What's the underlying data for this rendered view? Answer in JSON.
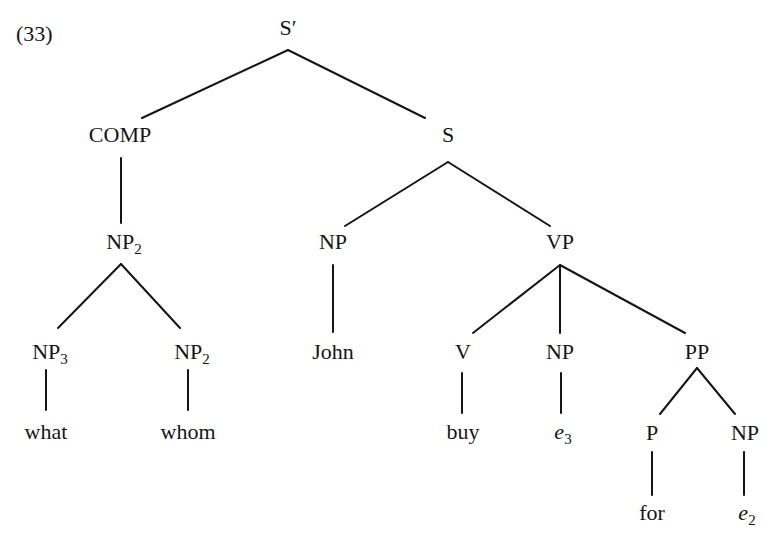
{
  "example_number": "(33)",
  "tree": {
    "nodes": [
      {
        "id": "s_bar",
        "label": "S′",
        "sub": "",
        "italic": false,
        "x": 288,
        "y": 16
      },
      {
        "id": "comp",
        "label": "COMP",
        "sub": "",
        "italic": false,
        "x": 120,
        "y": 123
      },
      {
        "id": "s",
        "label": "S",
        "sub": "",
        "italic": false,
        "x": 448,
        "y": 123
      },
      {
        "id": "np2_top",
        "label": "NP",
        "sub": "2",
        "italic": false,
        "x": 124,
        "y": 230
      },
      {
        "id": "np_subj",
        "label": "NP",
        "sub": "",
        "italic": false,
        "x": 333,
        "y": 230
      },
      {
        "id": "vp",
        "label": "VP",
        "sub": "",
        "italic": false,
        "x": 560,
        "y": 230
      },
      {
        "id": "np3",
        "label": "NP",
        "sub": "3",
        "italic": false,
        "x": 50,
        "y": 340
      },
      {
        "id": "np2_low",
        "label": "NP",
        "sub": "2",
        "italic": false,
        "x": 192,
        "y": 340
      },
      {
        "id": "john",
        "label": "John",
        "sub": "",
        "italic": false,
        "x": 333,
        "y": 340
      },
      {
        "id": "v",
        "label": "V",
        "sub": "",
        "italic": false,
        "x": 463,
        "y": 340
      },
      {
        "id": "np_obj",
        "label": "NP",
        "sub": "",
        "italic": false,
        "x": 560,
        "y": 340
      },
      {
        "id": "pp",
        "label": "PP",
        "sub": "",
        "italic": false,
        "x": 697,
        "y": 340
      },
      {
        "id": "what",
        "label": "what",
        "sub": "",
        "italic": false,
        "x": 46,
        "y": 420
      },
      {
        "id": "whom",
        "label": "whom",
        "sub": "",
        "italic": false,
        "x": 188,
        "y": 420
      },
      {
        "id": "buy",
        "label": "buy",
        "sub": "",
        "italic": false,
        "x": 463,
        "y": 420
      },
      {
        "id": "e3",
        "label": "e",
        "sub": "3",
        "italic": true,
        "x": 563,
        "y": 420
      },
      {
        "id": "p",
        "label": "P",
        "sub": "",
        "italic": false,
        "x": 652,
        "y": 421
      },
      {
        "id": "np_pobj",
        "label": "NP",
        "sub": "",
        "italic": false,
        "x": 745,
        "y": 421
      },
      {
        "id": "for",
        "label": "for",
        "sub": "",
        "italic": false,
        "x": 652,
        "y": 501
      },
      {
        "id": "e2",
        "label": "e",
        "sub": "2",
        "italic": true,
        "x": 747,
        "y": 501
      }
    ],
    "edges": [
      {
        "from": "s_bar",
        "to": "comp",
        "x1": 288,
        "y1": 50,
        "x2": 142,
        "y2": 118
      },
      {
        "from": "s_bar",
        "to": "s",
        "x1": 288,
        "y1": 50,
        "x2": 425,
        "y2": 118
      },
      {
        "from": "comp",
        "to": "np2_top",
        "x1": 121,
        "y1": 158,
        "x2": 121,
        "y2": 223
      },
      {
        "from": "s",
        "to": "np_subj",
        "x1": 448,
        "y1": 162,
        "x2": 345,
        "y2": 226
      },
      {
        "from": "s",
        "to": "vp",
        "x1": 448,
        "y1": 162,
        "x2": 550,
        "y2": 226
      },
      {
        "from": "np2_top",
        "to": "np3",
        "x1": 121,
        "y1": 264,
        "x2": 58,
        "y2": 328
      },
      {
        "from": "np2_top",
        "to": "np2_low",
        "x1": 121,
        "y1": 264,
        "x2": 180,
        "y2": 328
      },
      {
        "from": "np_subj",
        "to": "john",
        "x1": 333,
        "y1": 265,
        "x2": 333,
        "y2": 332
      },
      {
        "from": "vp",
        "to": "v",
        "x1": 560,
        "y1": 265,
        "x2": 473,
        "y2": 333
      },
      {
        "from": "vp",
        "to": "np_obj",
        "x1": 560,
        "y1": 265,
        "x2": 560,
        "y2": 333
      },
      {
        "from": "vp",
        "to": "pp",
        "x1": 560,
        "y1": 265,
        "x2": 685,
        "y2": 333
      },
      {
        "from": "np3",
        "to": "what",
        "x1": 46,
        "y1": 370,
        "x2": 46,
        "y2": 410
      },
      {
        "from": "np2_low",
        "to": "whom",
        "x1": 188,
        "y1": 370,
        "x2": 188,
        "y2": 410
      },
      {
        "from": "v",
        "to": "buy",
        "x1": 462,
        "y1": 373,
        "x2": 462,
        "y2": 413
      },
      {
        "from": "np_obj",
        "to": "e3",
        "x1": 561,
        "y1": 373,
        "x2": 561,
        "y2": 413
      },
      {
        "from": "pp",
        "to": "p",
        "x1": 697,
        "y1": 368,
        "x2": 660,
        "y2": 414
      },
      {
        "from": "pp",
        "to": "np_pobj",
        "x1": 697,
        "y1": 368,
        "x2": 735,
        "y2": 414
      },
      {
        "from": "p",
        "to": "for",
        "x1": 652,
        "y1": 452,
        "x2": 652,
        "y2": 495
      },
      {
        "from": "np_pobj",
        "to": "e2",
        "x1": 744,
        "y1": 452,
        "x2": 744,
        "y2": 495
      }
    ]
  },
  "colors": {
    "ink": "#151515",
    "background": "#ffffff"
  }
}
